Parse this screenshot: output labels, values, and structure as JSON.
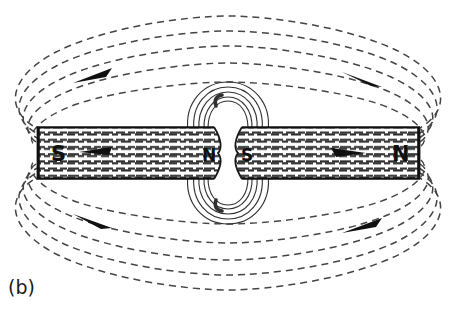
{
  "figure": {
    "caption": "(b)",
    "background_color": "#ffffff",
    "line_color": "#404040",
    "ink_color": "#101010",
    "magnet": {
      "name": "bar-magnet",
      "left_end_label": "S",
      "right_end_label": "N",
      "gap_left_label": "N",
      "gap_right_label": "S",
      "x": 37,
      "y": 127,
      "width": 383,
      "height": 52,
      "gap_center_x": 228,
      "gap_width": 16,
      "interior_texture": "horizontal-dashed-fieldlines",
      "interior_arrows": [
        {
          "name": "interior-arrow-left",
          "x": 95,
          "y": 152,
          "direction": "left"
        },
        {
          "name": "interior-arrow-right",
          "x": 348,
          "y": 153,
          "direction": "right"
        }
      ]
    },
    "external_field_lines": {
      "count_upper": 5,
      "count_lower": 5,
      "style": "dashed",
      "dash_pattern": "7 5",
      "arrows": [
        {
          "name": "field-arrow-upper-left",
          "x": 95,
          "y": 73,
          "direction": "right"
        },
        {
          "name": "field-arrow-upper-right",
          "x": 362,
          "y": 78,
          "direction": "right"
        },
        {
          "name": "field-arrow-lower-left",
          "x": 95,
          "y": 222,
          "direction": "right"
        },
        {
          "name": "field-arrow-lower-right",
          "x": 362,
          "y": 223,
          "direction": "right"
        }
      ]
    },
    "gap_field_lines": {
      "count": 5,
      "style": "solid-thin",
      "description": "field lines bulging out of the central gap above and below"
    }
  }
}
